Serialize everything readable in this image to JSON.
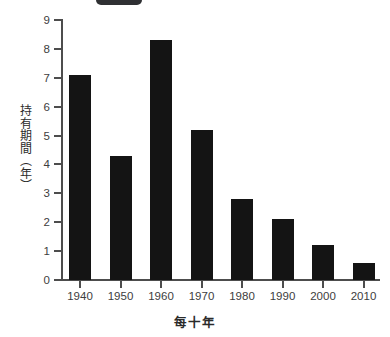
{
  "decoration": {
    "top_fragment_color": "#2f3033",
    "top_fragment_name": "cropped-pill-fragment"
  },
  "chart_data": {
    "type": "bar",
    "title": "",
    "subtitle": "",
    "categories": [
      "1940",
      "1950",
      "1960",
      "1970",
      "1980",
      "1990",
      "2000",
      "2010"
    ],
    "values": [
      7.1,
      4.3,
      8.3,
      5.2,
      2.8,
      2.1,
      1.2,
      0.6
    ],
    "series": [
      {
        "name": "持有期間",
        "values": [
          7.1,
          4.3,
          8.3,
          5.2,
          2.8,
          2.1,
          1.2,
          0.6
        ]
      }
    ],
    "xlabel": "每十年",
    "ylabel": "持有期間（年）",
    "ylim": [
      0,
      9
    ],
    "yticks": [
      0,
      1,
      2,
      3,
      4,
      5,
      6,
      7,
      8,
      9
    ],
    "ytick_labels": [
      "0",
      "1",
      "2",
      "3",
      "4",
      "5",
      "6",
      "7",
      "8",
      "9"
    ],
    "xtick_labels": [
      "1940",
      "1950",
      "1960",
      "1970",
      "1980",
      "1990",
      "2000",
      "2010"
    ],
    "grid": false,
    "legend": false,
    "legend_position": "none",
    "bar_color": "#141414",
    "axis_color": "#4d4d4d",
    "background_color": "#ffffff",
    "annotations": []
  }
}
